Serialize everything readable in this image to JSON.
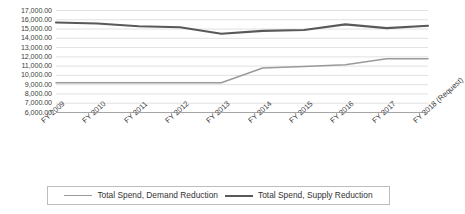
{
  "chart_data": {
    "type": "line",
    "title": "",
    "xlabel": "",
    "ylabel": "",
    "categories": [
      "FY 2009",
      "FY 2010",
      "FY 2011",
      "FY 2012",
      "FY 2013",
      "FY 2014",
      "FY 2015",
      "FY 2016",
      "FY 2017",
      "FY 2018 (Request)"
    ],
    "series": [
      {
        "name": "Total Spend, Demand Reduction",
        "color": "#9a9a9a",
        "values": [
          9200,
          9200,
          9200,
          9200,
          9200,
          10800,
          10950,
          11150,
          11800,
          11800
        ]
      },
      {
        "name": "Total Spend, Supply Reduction",
        "color": "#595959",
        "values": [
          15700,
          15600,
          15300,
          15200,
          14500,
          14800,
          14900,
          15500,
          15100,
          15350
        ]
      }
    ],
    "ylim": [
      6000,
      17000
    ],
    "yticks": [
      17000,
      16000,
      15000,
      14000,
      13000,
      12000,
      11000,
      10000,
      9000,
      8000,
      7000,
      6000
    ],
    "ytick_labels": [
      "17,000.00",
      "16,000.00",
      "15,000.00",
      "14,000.00",
      "13,000.00",
      "12,000.00",
      "11,000.00",
      "10,000.00",
      "9,000.00",
      "8,000.00",
      "7,000.00",
      "6,000.00"
    ],
    "grid": true,
    "gridlines": "horizontal",
    "legend_position": "bottom"
  },
  "legend": {
    "entries": [
      {
        "label": "Total Spend, Demand Reduction"
      },
      {
        "label": "Total Spend, Supply Reduction"
      }
    ]
  }
}
